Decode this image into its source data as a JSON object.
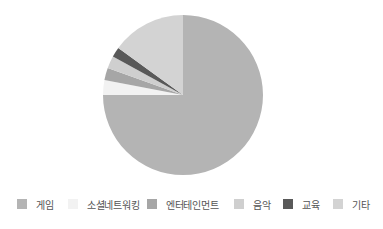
{
  "chart_data": {
    "type": "pie",
    "title": "",
    "start_angle_deg": 0,
    "direction": "clockwise",
    "categories": [
      "게임",
      "소셜네트워킹",
      "엔터테인먼트",
      "음악",
      "교육",
      "기타"
    ],
    "values": [
      75,
      3,
      2.5,
      2.5,
      2,
      15
    ],
    "colors": [
      "#b4b4b4",
      "#f2f2f2",
      "#a6a6a6",
      "#cfcfcf",
      "#595959",
      "#d3d3d3"
    ],
    "legend_position": "bottom"
  },
  "legend": {
    "items": [
      {
        "label": "게임",
        "color": "#b4b4b4",
        "x": 17
      },
      {
        "label": "소셜네트워킹",
        "color": "#f2f2f2",
        "x": 68
      },
      {
        "label": "엔터테인먼트",
        "color": "#a6a6a6",
        "x": 147
      },
      {
        "label": "음악",
        "color": "#cfcfcf",
        "x": 234
      },
      {
        "label": "교육",
        "color": "#595959",
        "x": 283
      },
      {
        "label": "기타",
        "color": "#d3d3d3",
        "x": 333
      }
    ]
  }
}
